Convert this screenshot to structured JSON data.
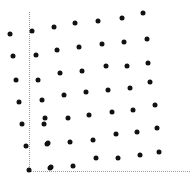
{
  "figure": {
    "width": 192,
    "height": 182,
    "background": "#ffffff",
    "marker_color": "#111111",
    "axis_color": "#9a9a9a",
    "marker_size": 5
  },
  "axes": {
    "y_axis": {
      "x": 29,
      "y_top": 12,
      "y_bottom": 171,
      "style": "dotted"
    },
    "x_axis": {
      "y": 171,
      "x_left": 29,
      "x_right": 190,
      "style": "dotted"
    },
    "origin": {
      "x": 29,
      "y": 171
    }
  },
  "chart_data": {
    "type": "scatter",
    "title": "",
    "xlabel": "",
    "ylabel": "",
    "grid": false,
    "legend": null,
    "xlim": [
      0,
      192
    ],
    "ylim": [
      0,
      182
    ],
    "series": [
      {
        "name": "points",
        "color": "#111111",
        "marker": "circle",
        "points": [
          [
            10,
            34
          ],
          [
            13,
            56
          ],
          [
            16,
            80
          ],
          [
            19,
            102
          ],
          [
            22,
            124
          ],
          [
            26,
            146
          ],
          [
            29,
            170
          ],
          [
            32,
            31
          ],
          [
            36,
            55
          ],
          [
            38,
            80
          ],
          [
            42,
            100
          ],
          [
            44,
            124
          ],
          [
            47,
            144
          ],
          [
            50,
            168
          ],
          [
            54,
            27
          ],
          [
            57,
            50
          ],
          [
            60,
            73
          ],
          [
            64,
            95
          ],
          [
            45,
            118
          ],
          [
            48,
            143
          ],
          [
            51,
            167
          ],
          [
            75,
            23
          ],
          [
            79,
            47
          ],
          [
            82,
            71
          ],
          [
            86,
            92
          ],
          [
            68,
            118
          ],
          [
            70,
            142
          ],
          [
            73,
            166
          ],
          [
            98,
            21
          ],
          [
            102,
            44
          ],
          [
            106,
            66
          ],
          [
            108,
            90
          ],
          [
            89,
            115
          ],
          [
            93,
            140
          ],
          [
            96,
            158
          ],
          [
            122,
            18
          ],
          [
            124,
            42
          ],
          [
            127,
            66
          ],
          [
            130,
            88
          ],
          [
            112,
            112
          ],
          [
            116,
            134
          ],
          [
            118,
            158
          ],
          [
            143,
            13
          ],
          [
            147,
            39
          ],
          [
            148,
            63
          ],
          [
            150,
            82
          ],
          [
            133,
            110
          ],
          [
            137,
            132
          ],
          [
            140,
            155
          ],
          [
            155,
            105
          ],
          [
            157,
            128
          ],
          [
            159,
            152
          ]
        ]
      }
    ]
  }
}
